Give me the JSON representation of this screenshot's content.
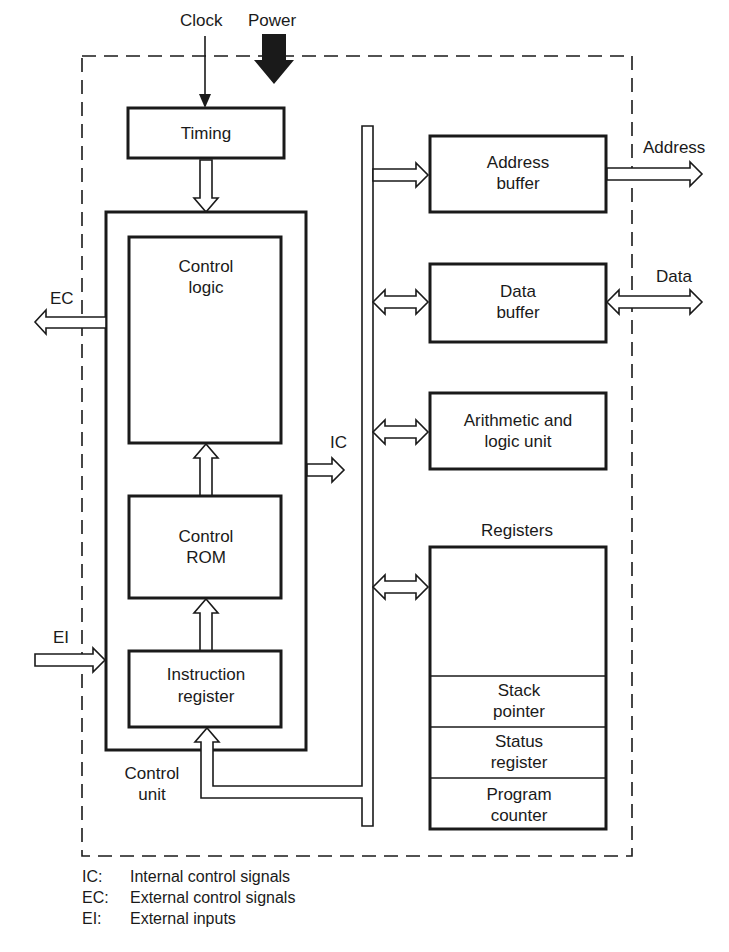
{
  "diagram": {
    "external_signals": {
      "clock": "Clock",
      "power": "Power",
      "address": "Address",
      "data": "Data",
      "ec": "EC",
      "ei": "EI",
      "ic": "IC"
    },
    "blocks": {
      "timing": {
        "line1": "Timing"
      },
      "control_logic": {
        "line1": "Control",
        "line2": "logic"
      },
      "control_rom": {
        "line1": "Control",
        "line2": "ROM"
      },
      "instruction_register": {
        "line1": "Instruction",
        "line2": "register"
      },
      "control_unit": {
        "line1": "Control",
        "line2": "unit"
      },
      "address_buffer": {
        "line1": "Address",
        "line2": "buffer"
      },
      "data_buffer": {
        "line1": "Data",
        "line2": "buffer"
      },
      "alu": {
        "line1": "Arithmetic and",
        "line2": "logic unit"
      },
      "registers": {
        "title": "Registers",
        "items": [
          {
            "line1": "Stack",
            "line2": "pointer"
          },
          {
            "line1": "Status",
            "line2": "register"
          },
          {
            "line1": "Program",
            "line2": "counter"
          }
        ]
      }
    },
    "colors": {
      "ink": "#1a1a1a",
      "background": "#ffffff"
    }
  },
  "legend": [
    {
      "abbr": "IC:",
      "text": "Internal control signals"
    },
    {
      "abbr": "EC:",
      "text": "External control signals"
    },
    {
      "abbr": "EI:",
      "text": "External inputs"
    }
  ]
}
